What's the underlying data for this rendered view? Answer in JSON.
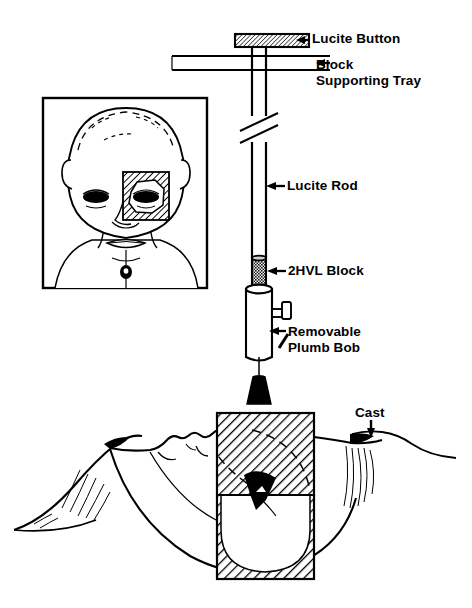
{
  "figure": {
    "background_color": "#ffffff",
    "ink_color": "#000000",
    "width": 472,
    "height": 608
  },
  "labels": {
    "lucite_button": "Lucite Button",
    "block_supporting_tray_line1": "Block",
    "block_supporting_tray_line2": "Supporting Tray",
    "lucite_rod": "Lucite Rod",
    "hvl_block": "2HVL Block",
    "plumb_bob_line1": "Removable",
    "plumb_bob_line2": "Plumb Bob",
    "cast": "Cast"
  },
  "parts": {
    "lucite_button": {
      "name": "Lucite Button",
      "fill": "hatched",
      "arrow_direction": "left"
    },
    "block_supporting_tray": {
      "name": "Block Supporting Tray",
      "arrow_direction": "left"
    },
    "lucite_rod": {
      "name": "Lucite Rod",
      "break_symbol": "true",
      "arrow_direction": "left"
    },
    "hvl_block": {
      "name": "2HVL Block",
      "fill": "stippled-dark",
      "arrow_direction": "left"
    },
    "holder_cylinder": {
      "name": "Block Holder Cylinder",
      "thumbscrew": "true"
    },
    "plumb_bob": {
      "name": "Removable Plumb Bob",
      "fill": "solid-black",
      "arrow_direction": "up-right"
    },
    "cast": {
      "name": "Cast",
      "arrow_direction": "down"
    }
  },
  "inset": {
    "name": "Infant frontal face view",
    "frame": "rectangle",
    "radiation_field": {
      "name": "Eye radiation field",
      "side": "left eye of patient",
      "fill": "hatched",
      "aperture_shape": "octagon"
    }
  },
  "profile": {
    "name": "Infant lateral profile view, supine",
    "radiation_field": {
      "name": "Lateral beam field",
      "fill": "hatched",
      "shield_shape": "half-circle"
    }
  }
}
